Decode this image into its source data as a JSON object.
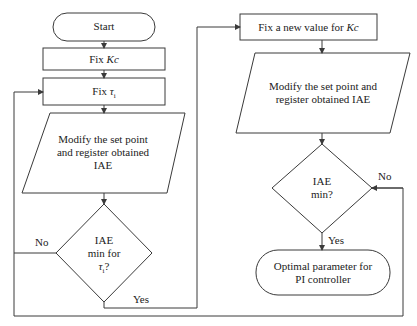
{
  "diagram": {
    "type": "flowchart",
    "left_column": {
      "start": "Start",
      "fix_kc": {
        "prefix": "Fix ",
        "var": "Kc"
      },
      "fix_tau": {
        "prefix": "Fix ",
        "var": "τ",
        "sub": "i"
      },
      "modify": [
        "Modify the set point",
        "and register obtained",
        "IAE"
      ],
      "decision": {
        "lines": [
          "IAE",
          "min for"
        ],
        "var": "τ",
        "sub": "i",
        "suffix": "?"
      },
      "no_label": "No",
      "yes_label": "Yes"
    },
    "right_column": {
      "fix_new_kc": {
        "prefix": "Fix a new value for ",
        "var": "Kc"
      },
      "modify": [
        "Modify the set point and",
        "register obtained IAE"
      ],
      "decision": [
        "IAE",
        "min?"
      ],
      "no_label": "No",
      "yes_label": "Yes",
      "end": [
        "Optimal parameter for",
        "PI controller"
      ]
    },
    "colors": {
      "stroke": "#3a3a3a",
      "text": "#222222",
      "background": "#ffffff"
    }
  }
}
